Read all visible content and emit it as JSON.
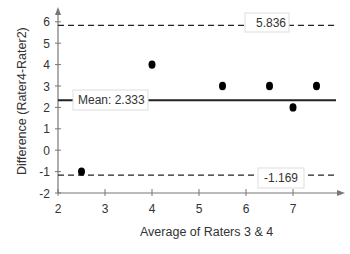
{
  "chart_data": {
    "type": "scatter",
    "title": "",
    "xlabel": "Average of Raters 3 & 4",
    "ylabel": "Difference (Rater4-Rater2)",
    "xlim": [
      2,
      7.9
    ],
    "ylim": [
      -2,
      6.5
    ],
    "x_ticks": [
      2,
      3,
      4,
      5,
      6,
      7
    ],
    "y_ticks": [
      -2,
      -1,
      0,
      1,
      2,
      3,
      4,
      5,
      6
    ],
    "grid": false,
    "legend": null,
    "series": [
      {
        "name": "Differences",
        "points": [
          {
            "x": 2.5,
            "y": -1
          },
          {
            "x": 4.0,
            "y": 4
          },
          {
            "x": 5.5,
            "y": 3
          },
          {
            "x": 6.5,
            "y": 3
          },
          {
            "x": 7.0,
            "y": 2
          },
          {
            "x": 7.5,
            "y": 3
          }
        ]
      }
    ],
    "reference_lines": [
      {
        "name": "upper-limit",
        "y": 5.836,
        "style": "dashed",
        "label": "5.836"
      },
      {
        "name": "mean",
        "y": 2.333,
        "style": "solid",
        "label": "Mean: 2.333"
      },
      {
        "name": "lower-limit",
        "y": -1.169,
        "style": "dashed",
        "label": "-1.169"
      }
    ]
  },
  "labels": {
    "upper": "5.836",
    "mean": "Mean: 2.333",
    "lower": "-1.169",
    "xlabel": "Average of Raters 3 & 4",
    "ylabel": "Difference (Rater4-Rater2)"
  }
}
